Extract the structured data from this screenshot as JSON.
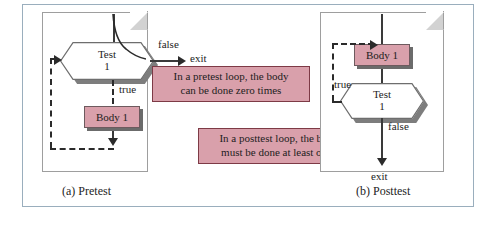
{
  "figure": {
    "panels": [
      {
        "id": "pretest",
        "caption": "(a) Pretest",
        "decision_line1": "Test",
        "decision_line2": "1",
        "process_label": "Body 1",
        "branch_false": "false",
        "branch_true": "true",
        "exit_label": "exit"
      },
      {
        "id": "posttest",
        "caption": "(b) Posttest",
        "decision_line1": "Test",
        "decision_line2": "1",
        "process_label": "Body 1",
        "branch_false": "false",
        "branch_true": "true",
        "exit_label": "exit"
      }
    ],
    "callouts": [
      {
        "id": "pretest-note",
        "line1": "In a pretest loop, the body",
        "line2": "can be done zero times"
      },
      {
        "id": "posttest-note",
        "line1": "In a  posttest loop, the body",
        "line2": "must be done at least once"
      }
    ],
    "colors": {
      "process_fill": "#d9a0ab",
      "callout_fill": "#d9a0ab",
      "callout_border": "#7d3a46",
      "frame_border": "#9aaebd",
      "line": "#2b2b2b",
      "shadow": "#6b6b6b"
    }
  }
}
